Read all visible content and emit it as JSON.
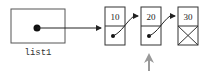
{
  "diagram": {
    "variable": {
      "label": "list1"
    },
    "nodes": [
      {
        "value": "10",
        "next": "node-20"
      },
      {
        "value": "20",
        "next": "node-30"
      },
      {
        "value": "30",
        "next": null
      }
    ],
    "pointer_marker": {
      "target": "node-20",
      "direction": "up"
    },
    "colors": {
      "stroke": "#333333",
      "marker": "#999999",
      "background": "#ffffff"
    }
  }
}
